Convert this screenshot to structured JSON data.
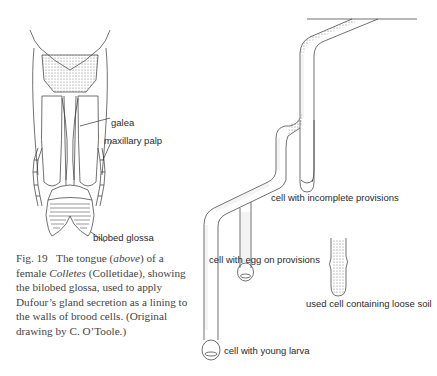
{
  "figure": {
    "number": "Fig. 19",
    "caption_parts": {
      "lead": "The tongue (",
      "above": "above",
      "mid": ") of a female ",
      "genus": "Colletes",
      "rest": " (Colletidae), showing the bilobed glossa, used to apply Dufour’s gland secretion as a lining to the walls of brood cells. (Original drawing by C. O’Toole.)"
    }
  },
  "tongue_labels": {
    "galea": "galea",
    "maxillary_palp": "maxillary palp",
    "bilobed_glossa": "bilobed glossa"
  },
  "nest_labels": {
    "incomplete": "cell with incomplete provisions",
    "egg": "cell with egg on provisions",
    "used": "used cell containing loose soil",
    "larva": "cell with young larva"
  },
  "colors": {
    "line": "#333333",
    "stipple": "#9a9a9a",
    "caption_text": "#444444"
  }
}
